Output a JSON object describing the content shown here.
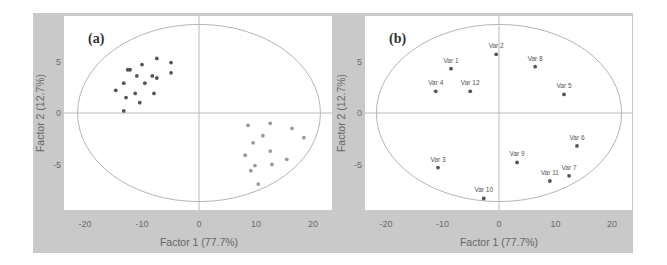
{
  "chart_data": [
    {
      "type": "scatter",
      "panel_label": "(a)",
      "title": "",
      "xlabel": "Factor 1 (77.7%)",
      "ylabel": "Factor 2 (12.7%)",
      "xlim": [
        -23,
        23
      ],
      "ylim": [
        -9.3,
        9.5
      ],
      "xticks": [
        -20,
        -10,
        0,
        10,
        20
      ],
      "yticks": [
        5,
        0,
        -5
      ],
      "grid": false,
      "reference_lines": {
        "x": 0,
        "y": 0
      },
      "ellipse": {
        "cx": 0,
        "cy": 0,
        "rx": 21.3,
        "ry": 8.6
      },
      "series": [
        {
          "name": "group-1",
          "color": "#555555",
          "points": [
            [
              -14.6,
              2.2
            ],
            [
              -13.2,
              2.9
            ],
            [
              -12.8,
              1.5
            ],
            [
              -13.2,
              0.2
            ],
            [
              -12.5,
              4.2
            ],
            [
              -12.1,
              4.2
            ],
            [
              -11.2,
              1.9
            ],
            [
              -10.9,
              3.6
            ],
            [
              -10.4,
              1.0
            ],
            [
              -10.0,
              4.7
            ],
            [
              -9.5,
              2.9
            ],
            [
              -8.2,
              3.6
            ],
            [
              -7.9,
              1.9
            ],
            [
              -7.4,
              5.3
            ],
            [
              -7.4,
              3.4
            ],
            [
              -4.9,
              4.9
            ],
            [
              -4.9,
              3.9
            ]
          ]
        },
        {
          "name": "group-2",
          "color": "#9a9a9a",
          "points": [
            [
              8.6,
              -1.2
            ],
            [
              12.5,
              -1.0
            ],
            [
              16.3,
              -1.5
            ],
            [
              11.2,
              -2.2
            ],
            [
              18.4,
              -2.4
            ],
            [
              9.5,
              -2.9
            ],
            [
              12.5,
              -3.7
            ],
            [
              8.1,
              -4.1
            ],
            [
              15.4,
              -4.5
            ],
            [
              9.8,
              -5.1
            ],
            [
              12.8,
              -5.0
            ],
            [
              9.1,
              -5.6
            ],
            [
              10.4,
              -6.9
            ]
          ]
        }
      ]
    },
    {
      "type": "scatter",
      "panel_label": "(b)",
      "title": "",
      "xlabel": "Factor 1 (77.7%)",
      "ylabel": "Factor 2 (12.7%)",
      "xlim": [
        -23.5,
        23.5
      ],
      "ylim": [
        -9.3,
        9.5
      ],
      "xticks": [
        -20,
        -10,
        0,
        10,
        20
      ],
      "yticks": [
        5,
        0,
        -5
      ],
      "grid": false,
      "reference_lines": {
        "x": 0,
        "y": 0
      },
      "ellipse": {
        "cx": 0,
        "cy": 0,
        "rx": 21.7,
        "ry": 8.6
      },
      "series": [
        {
          "name": "variables",
          "color": "#555555",
          "points": [
            {
              "label": "Var 1",
              "x": -8.5,
              "y": 4.3
            },
            {
              "label": "Var 2",
              "x": -0.5,
              "y": 5.7
            },
            {
              "label": "Var 3",
              "x": -10.8,
              "y": -5.3
            },
            {
              "label": "Var 4",
              "x": -11.2,
              "y": 2.1
            },
            {
              "label": "Var 5",
              "x": 11.5,
              "y": 1.8
            },
            {
              "label": "Var 6",
              "x": 13.8,
              "y": -3.2
            },
            {
              "label": "Var 7",
              "x": 12.4,
              "y": -6.1
            },
            {
              "label": "Var 8",
              "x": 6.4,
              "y": 4.5
            },
            {
              "label": "Var 9",
              "x": 3.2,
              "y": -4.8
            },
            {
              "label": "Var 10",
              "x": -2.7,
              "y": -8.3
            },
            {
              "label": "Var 11",
              "x": 9.0,
              "y": -6.6
            },
            {
              "label": "Var 12",
              "x": -5.1,
              "y": 2.1
            }
          ]
        }
      ]
    }
  ],
  "colors": {
    "outer_background": "#c9c9c9",
    "plot_background": "#ffffff",
    "ellipse": "#b5b5b5",
    "axis_lines": "#a8a8a8",
    "tick_text": "#6a6a6a",
    "label_text": "#666666"
  }
}
